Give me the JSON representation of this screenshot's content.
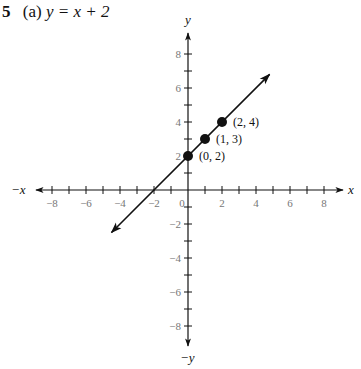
{
  "problem": {
    "number": "5",
    "part": "(a)",
    "equation": "y = x + 2"
  },
  "chart_data": {
    "type": "line",
    "title": "(a) y = x + 2",
    "xlabel": "x",
    "ylabel": "y",
    "xlabel_neg": "−x",
    "ylabel_neg": "−y",
    "xlim": [
      -9,
      9
    ],
    "ylim": [
      -9,
      9
    ],
    "grid": false,
    "x_ticks": [
      -8,
      -7,
      -6,
      -5,
      -4,
      -3,
      -2,
      -1,
      1,
      2,
      3,
      4,
      5,
      6,
      7,
      8
    ],
    "x_tick_labels": [
      "−8",
      "−6",
      "−4",
      "−2",
      "0",
      "2",
      "4",
      "6",
      "8"
    ],
    "y_tick_labels": [
      "8",
      "6",
      "4",
      "2",
      "−2",
      "−4",
      "−6",
      "−8"
    ],
    "series": [
      {
        "name": "y = x + 2",
        "slope": 1,
        "intercept": 2,
        "x": [
          -4.5,
          4.8
        ],
        "y": [
          -2.5,
          6.8
        ],
        "arrows": "both"
      }
    ],
    "points": [
      {
        "x": 0,
        "y": 2,
        "label": "(0, 2)"
      },
      {
        "x": 1,
        "y": 3,
        "label": "(1, 3)"
      },
      {
        "x": 2,
        "y": 4,
        "label": "(2, 4)"
      }
    ]
  }
}
